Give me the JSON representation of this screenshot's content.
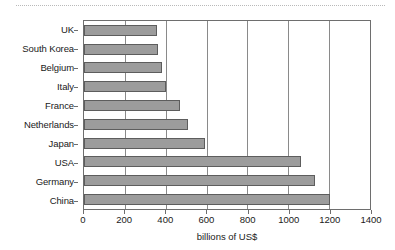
{
  "figure": {
    "top_rule": "dotted-divider",
    "background": "#ffffff"
  },
  "chart_data": {
    "type": "bar",
    "orientation": "horizontal",
    "title": "",
    "subtitle": "",
    "xlabel": "billions of US$",
    "ylabel": "",
    "categories": [
      "UK",
      "South Korea",
      "Belgium",
      "Italy",
      "France",
      "Netherlands",
      "Japan",
      "USA",
      "Germany",
      "China"
    ],
    "values": [
      355,
      360,
      380,
      400,
      470,
      510,
      590,
      1060,
      1130,
      1205
    ],
    "xlim": [
      0,
      1400
    ],
    "xticks": [
      0,
      200,
      400,
      600,
      800,
      1000,
      1200,
      1400
    ],
    "xticklabels": [
      "0",
      "200",
      "400",
      "600",
      "800",
      "1000",
      "1200",
      "1400"
    ],
    "grid": "vertical",
    "legend": "none",
    "bar_color": "#9c9c9c",
    "bar_edge_color": "#5d5d5d",
    "axis_color": "#6e6e6e"
  }
}
